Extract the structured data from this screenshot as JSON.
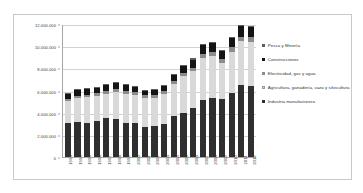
{
  "chart_data": {
    "type": "bar",
    "stacked": true,
    "title": "",
    "subtitle": "",
    "xlabel": "",
    "ylabel": "",
    "ylim": [
      0,
      12000000
    ],
    "ytick_labels": [
      "12.000.000",
      "10.000.000",
      "8.000.000",
      "6.000.000",
      "4.000.000",
      "2.000.000",
      "0"
    ],
    "ytick_values": [
      12000000,
      10000000,
      8000000,
      6000000,
      4000000,
      2000000,
      0
    ],
    "grid": "horizontal",
    "legend_position": "right",
    "categories": [
      "1993",
      "1994",
      "1995",
      "1996",
      "1997",
      "1998",
      "1999",
      "2000",
      "2001",
      "2002",
      "2003",
      "2004",
      "2005",
      "2006",
      "2007",
      "2008",
      "2009",
      "2010",
      "2011",
      "2012"
    ],
    "stack_order_bottom_to_top": [
      "Industria manufacturera",
      "Agricultura, ganadería, caza y silvicultura",
      "Electricidad, gas y agua",
      "Construcciones",
      "Pesca y Minería"
    ],
    "series": [
      {
        "name": "Industria manufacturera",
        "color": "#2f2f2f",
        "values": [
          3050000,
          3180000,
          3080000,
          3250000,
          3520000,
          3450000,
          3080000,
          3060000,
          2700000,
          2820000,
          2980000,
          3680000,
          3990000,
          4380000,
          5130000,
          5300000,
          5250000,
          5780000,
          6540000,
          6450000
        ]
      },
      {
        "name": "Agricultura, ganadería, caza y silvicultura",
        "color": "#d9d9d9",
        "values": [
          1980000,
          2170000,
          2340000,
          2280000,
          2180000,
          2420000,
          2630000,
          2550000,
          2650000,
          2550000,
          2750000,
          2880000,
          3280000,
          3360000,
          3830000,
          3800000,
          3230000,
          3730000,
          3920000,
          3970000
        ]
      },
      {
        "name": "Electricidad, gas y agua",
        "color": "#8c8c8c",
        "values": [
          180000,
          190000,
          200000,
          210000,
          220000,
          230000,
          240000,
          250000,
          250000,
          240000,
          250000,
          270000,
          290000,
          320000,
          340000,
          360000,
          350000,
          380000,
          410000,
          420000
        ]
      },
      {
        "name": "Construcciones",
        "color": "#141414",
        "values": [
          480000,
          520000,
          500000,
          530000,
          590000,
          620000,
          530000,
          490000,
          400000,
          410000,
          450000,
          570000,
          660000,
          740000,
          790000,
          830000,
          760000,
          840000,
          950000,
          900000
        ]
      },
      {
        "name": "Pesca y Minería",
        "color": "#5e5e5e",
        "values": [
          60000,
          60000,
          70000,
          70000,
          80000,
          80000,
          80000,
          80000,
          80000,
          80000,
          90000,
          90000,
          100000,
          100000,
          110000,
          110000,
          100000,
          110000,
          120000,
          120000
        ]
      }
    ],
    "totals": [
      5750000,
      6120000,
      6190000,
      6340000,
      6590000,
      6800000,
      6560000,
      6430000,
      6080000,
      6100000,
      6520000,
      7490000,
      8320000,
      8900000,
      10200000,
      10400000,
      9690000,
      10840000,
      11940000,
      11860000
    ]
  },
  "legend": {
    "items": [
      {
        "label": "Pesca y Minería",
        "color": "#5e5e5e"
      },
      {
        "label": "Construcciones",
        "color": "#141414"
      },
      {
        "label": "Electricidad, gas y agua",
        "color": "#8c8c8c"
      },
      {
        "label": "Agricultura, ganadería, caza y silvicultura",
        "color": "#d9d9d9"
      },
      {
        "label": "Industria manufacturera",
        "color": "#2f2f2f"
      }
    ]
  }
}
